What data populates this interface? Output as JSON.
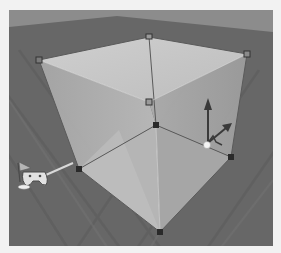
{
  "viewport": {
    "label": "3D scene viewport",
    "colors": {
      "sky": "#8c8c8c",
      "floor": "#676767",
      "floor_grain": "#5c5c5c",
      "cube_top": "#c9c9c9",
      "cube_left": "#b3b3b3",
      "cube_right": "#a8a8a8",
      "cube_bottom_left": "#b8b8b8",
      "cube_bottom_right": "#ababab",
      "edge": "#555555",
      "handle_solid": "#2a2a2a",
      "handle_hollow": "#8a8a8a"
    }
  },
  "cube": {
    "selected": true,
    "handles": [
      {
        "name": "top-back",
        "x": 140,
        "y": 27,
        "style": "hollow"
      },
      {
        "name": "top-left",
        "x": 30,
        "y": 50,
        "style": "hollow"
      },
      {
        "name": "top-right",
        "x": 238,
        "y": 44,
        "style": "hollow"
      },
      {
        "name": "top-front",
        "x": 140,
        "y": 92,
        "style": "hollow"
      },
      {
        "name": "center",
        "x": 147,
        "y": 115,
        "style": "solid"
      },
      {
        "name": "bottom-left",
        "x": 70,
        "y": 159,
        "style": "solid"
      },
      {
        "name": "bottom-right",
        "x": 222,
        "y": 147,
        "style": "solid"
      },
      {
        "name": "bottom-front",
        "x": 151,
        "y": 222,
        "style": "solid"
      }
    ]
  },
  "gizmo": {
    "type": "transform-move",
    "origin": {
      "x": 197,
      "y": 134
    }
  },
  "player_start": {
    "icon": "flag-gamepad",
    "x": 22,
    "y": 160
  }
}
